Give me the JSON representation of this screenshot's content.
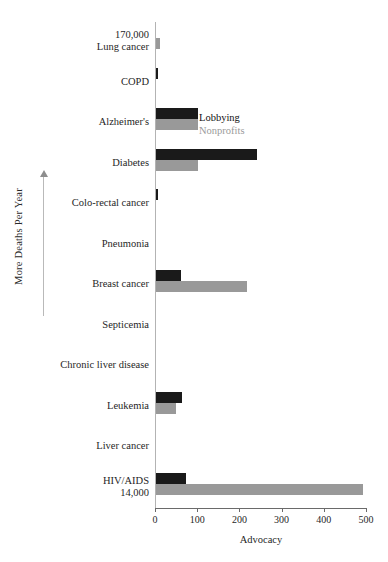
{
  "chart_data": {
    "type": "bar",
    "orientation": "horizontal",
    "title": "",
    "xlabel": "Advocacy",
    "ylabel": "More Deaths Per Year",
    "xlim": [
      0,
      500
    ],
    "xticks": [
      0,
      100,
      200,
      300,
      400,
      500
    ],
    "grid": false,
    "legend_position": "upper-center-inside",
    "categories": [
      "Lung cancer",
      "COPD",
      "Alzheimer's",
      "Diabetes",
      "Colo-rectal cancer",
      "Pneumonia",
      "Breast cancer",
      "Septicemia",
      "Chronic liver disease",
      "Leukemia",
      "Liver cancer",
      "HIV/AIDS"
    ],
    "series": [
      {
        "name": "Lobbying",
        "color": "#1a1a1a",
        "values": [
          0,
          3,
          100,
          240,
          3,
          0,
          60,
          0,
          0,
          62,
          0,
          70
        ]
      },
      {
        "name": "Nonprofits",
        "color": "#999999",
        "values": [
          10,
          0,
          100,
          100,
          0,
          0,
          215,
          0,
          0,
          48,
          0,
          490
        ]
      }
    ],
    "annotations": [
      {
        "category": "Lung cancer",
        "text": "170,000",
        "position": "above-label"
      },
      {
        "category": "HIV/AIDS",
        "text": "14,000",
        "position": "below-label"
      }
    ]
  },
  "axis": {
    "x_label": "Advocacy",
    "y_label": "More Deaths Per Year",
    "tick_labels": [
      "0",
      "100",
      "200",
      "300",
      "400",
      "500"
    ]
  },
  "legend": {
    "items": [
      {
        "label": "Lobbying",
        "color": "#1a1a1a"
      },
      {
        "label": "Nonprofits",
        "color": "#999999"
      }
    ]
  },
  "rows": [
    {
      "label": "Lung cancer",
      "deaths": "170,000",
      "deaths_pos": "above",
      "lobbying": 0,
      "nonprofits": 10
    },
    {
      "label": "COPD",
      "deaths": "",
      "deaths_pos": "",
      "lobbying": 3,
      "nonprofits": 0
    },
    {
      "label": "Alzheimer's",
      "deaths": "",
      "deaths_pos": "",
      "lobbying": 100,
      "nonprofits": 100
    },
    {
      "label": "Diabetes",
      "deaths": "",
      "deaths_pos": "",
      "lobbying": 240,
      "nonprofits": 100
    },
    {
      "label": "Colo-rectal cancer",
      "deaths": "",
      "deaths_pos": "",
      "lobbying": 3,
      "nonprofits": 0
    },
    {
      "label": "Pneumonia",
      "deaths": "",
      "deaths_pos": "",
      "lobbying": 0,
      "nonprofits": 0
    },
    {
      "label": "Breast cancer",
      "deaths": "",
      "deaths_pos": "",
      "lobbying": 60,
      "nonprofits": 215
    },
    {
      "label": "Septicemia",
      "deaths": "",
      "deaths_pos": "",
      "lobbying": 0,
      "nonprofits": 0
    },
    {
      "label": "Chronic liver disease",
      "deaths": "",
      "deaths_pos": "",
      "lobbying": 0,
      "nonprofits": 0
    },
    {
      "label": "Leukemia",
      "deaths": "",
      "deaths_pos": "",
      "lobbying": 62,
      "nonprofits": 48
    },
    {
      "label": "Liver cancer",
      "deaths": "",
      "deaths_pos": "",
      "lobbying": 0,
      "nonprofits": 0
    },
    {
      "label": "HIV/AIDS",
      "deaths": "14,000",
      "deaths_pos": "below",
      "lobbying": 70,
      "nonprofits": 490
    }
  ]
}
